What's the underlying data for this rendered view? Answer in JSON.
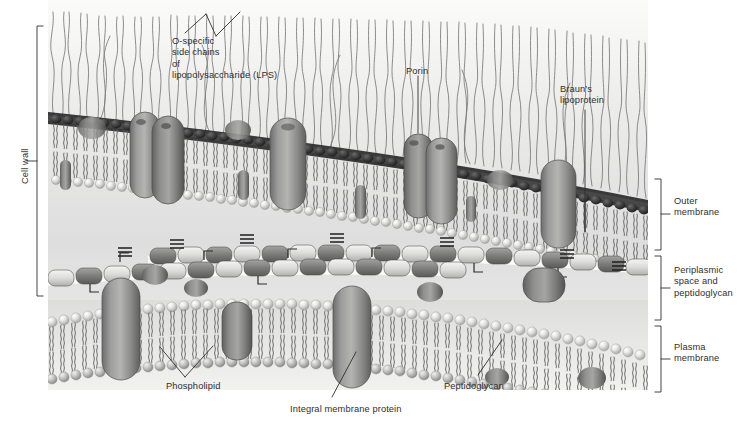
{
  "figure": {
    "style": "grayscale textbook illustration",
    "background_color": "#ffffff",
    "panel_color": "#e8e8e6",
    "ink_color": "#2f2f2f"
  },
  "brackets": {
    "left": [
      {
        "id": "cell-wall",
        "label": "Cell wall",
        "orientation": "vertical",
        "top": 25,
        "bottom": 295
      }
    ],
    "right": [
      {
        "id": "outer-membrane",
        "label": "Outer\nmembrane",
        "top": 178,
        "bottom": 250
      },
      {
        "id": "periplasm",
        "label": "Periplasmic\nspace and\npeptidoglycan",
        "top": 256,
        "bottom": 320
      },
      {
        "id": "plasma-membrane",
        "label": "Plasma\nmembrane",
        "top": 326,
        "bottom": 392
      }
    ]
  },
  "callouts": {
    "lps": {
      "label": "O-specific\nside chains\nof\nlipopolysaccharide (LPS)",
      "x": 172,
      "y": 36
    },
    "porin": {
      "label": "Porin",
      "x": 406,
      "y": 66
    },
    "brauns": {
      "label": "Braun's\nlipoprotein",
      "x": 560,
      "y": 84
    },
    "phospholipid": {
      "label": "Phospholipid",
      "x": 166,
      "y": 381
    },
    "integral_protein": {
      "label": "Integral membrane protein",
      "x": 290,
      "y": 404
    },
    "peptidoglycan": {
      "label": "Peptidoglycan",
      "x": 444,
      "y": 381
    }
  },
  "structures": {
    "lps_chains": "O-antigen side chains (wavy filaments above outer membrane)",
    "outer_membrane": "asymmetric bilayer: LPS outer leaflet, phospholipid inner leaflet",
    "peptidoglycan_layer": "glycan strands of alternating sugars with peptide cross-links",
    "plasma_membrane": "phospholipid bilayer with integral membrane proteins",
    "porins": "barrel-shaped channels spanning the outer membrane",
    "brauns_lipoprotein": "lipoprotein anchoring outer membrane to peptidoglycan"
  }
}
